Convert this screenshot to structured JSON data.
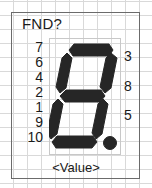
{
  "symbol": {
    "title": "FND?",
    "value_label": "<Value>",
    "component_type": "seven-segment-display",
    "colors": {
      "segment": "#262626",
      "border": "#6b6b6b",
      "grid": "#d9d9d9",
      "text": "#1a1a1a",
      "background": "#ffffff"
    }
  },
  "pins": {
    "left": [
      {
        "number": "7"
      },
      {
        "number": "6"
      },
      {
        "number": "4"
      },
      {
        "number": "2"
      },
      {
        "number": "1"
      },
      {
        "number": "9"
      },
      {
        "number": "10"
      }
    ],
    "right": [
      {
        "number": "3"
      },
      {
        "number": "8"
      },
      {
        "number": "5"
      }
    ]
  },
  "display": {
    "segments_lit": [
      "a",
      "b",
      "c",
      "d",
      "e",
      "f",
      "g"
    ],
    "decimal_point": true
  }
}
